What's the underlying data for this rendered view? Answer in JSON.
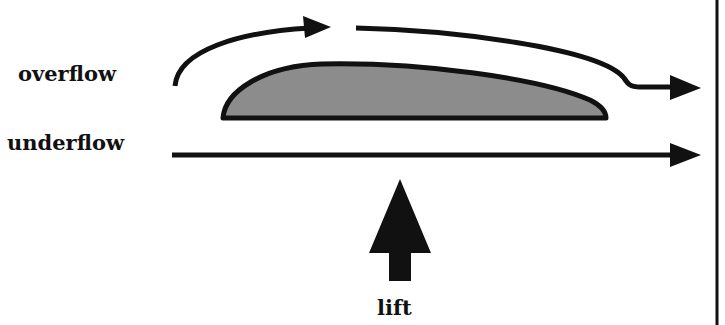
{
  "diagram": {
    "labels": {
      "overflow": "overflow",
      "underflow": "underflow",
      "lift": "lift"
    },
    "colors": {
      "stroke": "#111111",
      "airfoil_fill": "#8c8c8c",
      "background": "#ffffff"
    },
    "elements": [
      {
        "id": "airfoil",
        "shape": "airfoil-cross-section"
      },
      {
        "id": "overflow-arrow",
        "shape": "curved-arrow-over-airfoil"
      },
      {
        "id": "underflow-arrow",
        "shape": "straight-arrow-under-airfoil"
      },
      {
        "id": "lift-arrow",
        "shape": "upward-block-arrow"
      },
      {
        "id": "right-border",
        "shape": "vertical-line"
      }
    ]
  }
}
